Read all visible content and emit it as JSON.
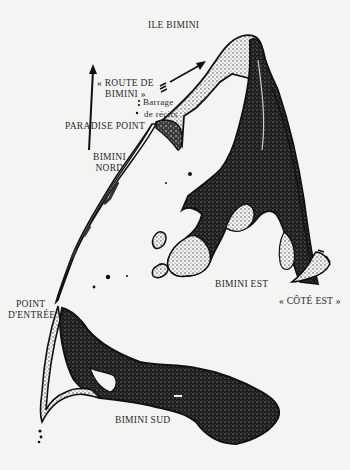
{
  "map": {
    "title": "ILE BIMINI",
    "language": "fr",
    "labels": {
      "title": "ILE BIMINI",
      "route_line1": "« ROUTE DE",
      "route_line2": "BIMINI »",
      "reef_line1": "Barrage",
      "reef_line2": "de récifs",
      "paradise_point": "PARADISE POINT",
      "north_line1": "BIMINI",
      "north_line2": "NORD",
      "entry_line1": "POINT",
      "entry_line2": "D'ENTRÉE",
      "east": "BIMINI EST",
      "east_coast": "« CÔTÉ EST »",
      "south": "BIMINI SUD"
    },
    "features": [
      {
        "name": "Bimini Nord",
        "type": "island"
      },
      {
        "name": "Bimini Est",
        "type": "island"
      },
      {
        "name": "Bimini Sud",
        "type": "island"
      },
      {
        "name": "Paradise Point",
        "type": "point"
      },
      {
        "name": "Point d'Entrée",
        "type": "point"
      },
      {
        "name": "Route de Bimini",
        "type": "underwater-formation"
      },
      {
        "name": "Barrage de récifs",
        "type": "reef"
      },
      {
        "name": "Côté Est",
        "type": "coast"
      }
    ],
    "north_arrow": true,
    "colors": {
      "background": "#f4f4f2",
      "ink": "#1a1a1a",
      "stipple": "#555555"
    }
  }
}
